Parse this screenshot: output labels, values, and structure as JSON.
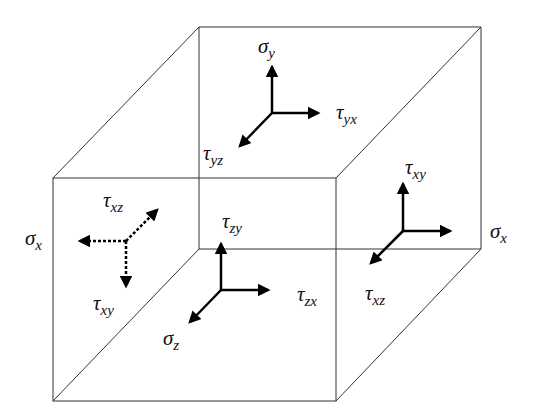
{
  "diagram": {
    "labels": {
      "sigma_y": {
        "sym": "σ",
        "sub": "y"
      },
      "tau_yx_top": {
        "sym": "τ",
        "sub": "yx"
      },
      "tau_yz_top": {
        "sym": "τ",
        "sub": "yz"
      },
      "tau_xz_left": {
        "sym": "τ",
        "sub": "xz"
      },
      "sigma_x_left": {
        "sym": "σ",
        "sub": "x"
      },
      "tau_xy_left": {
        "sym": "τ",
        "sub": "xy"
      },
      "tau_zy_front": {
        "sym": "τ",
        "sub": "zy"
      },
      "tau_zx_front": {
        "sym": "τ",
        "sub": "zx"
      },
      "sigma_z_front": {
        "sym": "σ",
        "sub": "z"
      },
      "tau_xy_right": {
        "sym": "τ",
        "sub": "xy"
      },
      "sigma_x_right": {
        "sym": "σ",
        "sub": "x"
      },
      "tau_xz_right": {
        "sym": "τ",
        "sub": "xz"
      }
    },
    "line_color": "#333333",
    "arrow_color": "#000000"
  }
}
